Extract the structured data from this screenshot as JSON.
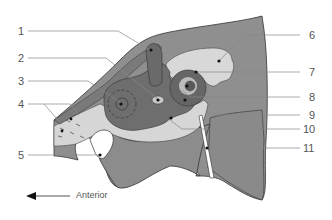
{
  "figure": {
    "type": "anatomical cross-section diagram",
    "direction_label": "Anterior",
    "direction_arrow": "arrow-left",
    "colors": {
      "tissue_dark": "#6f6f6f",
      "tissue_mid": "#8f8f8f",
      "tissue_light": "#d4d4d4",
      "outline": "#333333",
      "leader_line": "#888888",
      "label_text": "#555555"
    }
  },
  "labels_left": [
    {
      "number": "1"
    },
    {
      "number": "2"
    },
    {
      "number": "3"
    },
    {
      "number": "4"
    },
    {
      "number": "5"
    }
  ],
  "labels_right": [
    {
      "number": "6"
    },
    {
      "number": "7"
    },
    {
      "number": "8"
    },
    {
      "number": "9"
    },
    {
      "number": "10"
    },
    {
      "number": "11"
    }
  ]
}
